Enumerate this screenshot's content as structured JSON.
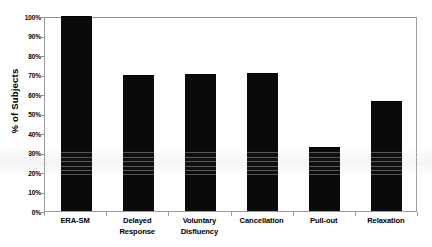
{
  "chart_data": {
    "type": "bar",
    "title": "",
    "subtitle": "",
    "xlabel": "",
    "ylabel": "% of Subjects",
    "categories": [
      "ERA-SM",
      "Delayed Response",
      "Voluntary Disfluency",
      "Cancellation",
      "Pull-out",
      "Relaxation"
    ],
    "category_lines": [
      [
        "ERA-SM"
      ],
      [
        "Delayed",
        "Response"
      ],
      [
        "Voluntary",
        "Disfluency"
      ],
      [
        "Cancellation"
      ],
      [
        "Pull-out"
      ],
      [
        "Relaxation"
      ]
    ],
    "values": [
      100,
      70,
      70.5,
      71,
      33,
      56.5
    ],
    "value_labels": [
      "100%",
      "70%",
      "70.5%",
      "71%",
      "33%",
      "56.5%"
    ],
    "ylim": [
      0,
      100
    ],
    "ytick_values": [
      100,
      90,
      80,
      70,
      60,
      50,
      40,
      30,
      20,
      10,
      0
    ],
    "ytick_labels": [
      "100%",
      "90%",
      "80%",
      "70%",
      "60%",
      "50%",
      "40%",
      "30%",
      "20%",
      "10%",
      "0%"
    ],
    "grid": false,
    "legend": null,
    "legend_position": "none",
    "bar_color": "#0a0a0a",
    "plot_border_color": "#9a9a9a",
    "background_color": "#ffffff",
    "annotations": []
  },
  "axes": {
    "y_title": "% of Subjects"
  }
}
